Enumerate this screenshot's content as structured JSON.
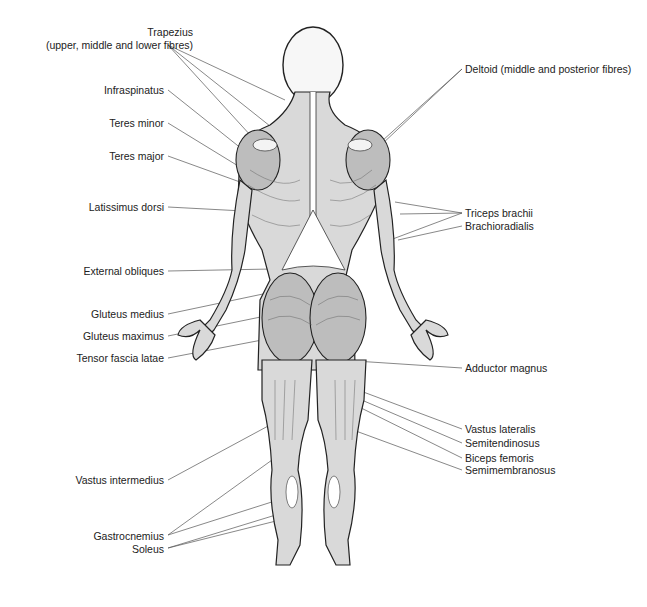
{
  "diagram": {
    "labels_left": [
      {
        "id": "trapezius",
        "text": "Trapezius",
        "x": 193,
        "y": 31
      },
      {
        "id": "trapezius-sub",
        "text": "(upper, middle and lower fibres)",
        "x": 193,
        "y": 44
      },
      {
        "id": "infraspinatus",
        "text": "Infraspinatus",
        "x": 164,
        "y": 84
      },
      {
        "id": "teres-minor",
        "text": "Teres minor",
        "x": 164,
        "y": 117
      },
      {
        "id": "teres-major",
        "text": "Teres major",
        "x": 164,
        "y": 150
      },
      {
        "id": "latissimus-dorsi",
        "text": "Latissimus dorsi",
        "x": 164,
        "y": 201
      },
      {
        "id": "external-obliques",
        "text": "External obliques",
        "x": 164,
        "y": 265
      },
      {
        "id": "gluteus-medius",
        "text": "Gluteus medius",
        "x": 164,
        "y": 308
      },
      {
        "id": "gluteus-maximus",
        "text": "Gluteus maximus",
        "x": 164,
        "y": 330
      },
      {
        "id": "tensor-fascia-latae",
        "text": "Tensor fascia latae",
        "x": 164,
        "y": 352
      },
      {
        "id": "vastus-intermedius",
        "text": "Vastus intermedius",
        "x": 164,
        "y": 474
      },
      {
        "id": "gastrocnemius",
        "text": "Gastrocnemius",
        "x": 164,
        "y": 530
      },
      {
        "id": "soleus",
        "text": "Soleus",
        "x": 164,
        "y": 543
      }
    ],
    "labels_right": [
      {
        "id": "deltoid",
        "text": "Deltoid (middle and posterior fibres)",
        "x": 465,
        "y": 63
      },
      {
        "id": "triceps-brachii",
        "text": "Triceps brachii",
        "x": 465,
        "y": 207
      },
      {
        "id": "brachioradialis",
        "text": "Brachioradialis",
        "x": 465,
        "y": 220
      },
      {
        "id": "adductor-magnus",
        "text": "Adductor magnus",
        "x": 465,
        "y": 362
      },
      {
        "id": "vastus-lateralis",
        "text": "Vastus lateralis",
        "x": 465,
        "y": 423
      },
      {
        "id": "semitendinosus",
        "text": "Semitendinosus",
        "x": 465,
        "y": 437
      },
      {
        "id": "biceps-femoris",
        "text": "Biceps femoris",
        "x": 465,
        "y": 452
      },
      {
        "id": "semimembranosus",
        "text": "Semimembranosus",
        "x": 465,
        "y": 464
      }
    ]
  }
}
